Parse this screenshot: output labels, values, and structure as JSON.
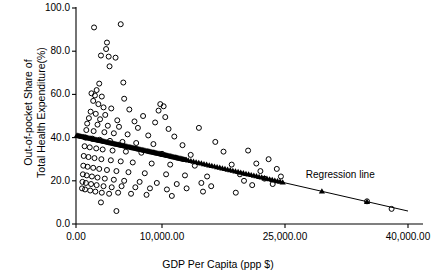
{
  "chart_data": {
    "type": "scatter",
    "title": "",
    "xlabel": "GDP Per Capita (ppp $)",
    "ylabel_line1": "Out-of-pocket Share of",
    "ylabel_line2": "Total Health Expenditure(%)",
    "xlim": [
      0,
      40000
    ],
    "ylim": [
      0,
      100
    ],
    "grid": false,
    "legend": "none",
    "xticks": [
      "0.00",
      "10,000.00",
      "25,000.00",
      "40,000.00"
    ],
    "xtick_values": [
      0,
      10000,
      25000,
      40000
    ],
    "yticks": [
      "0.0",
      "20.0",
      "40.0",
      "60.0",
      "80.0",
      "100.0"
    ],
    "ytick_values": [
      0,
      20,
      40,
      60,
      80,
      100
    ],
    "marker": "open-circle",
    "annotations": [
      {
        "text": "Regression line",
        "x": 29000,
        "y": 22.0
      }
    ],
    "series": [
      {
        "name": "Countries",
        "marker": "open-circle",
        "points": [
          [
            2100,
            91.0
          ],
          [
            5200,
            92.5
          ],
          [
            3600,
            84.0
          ],
          [
            3500,
            81.0
          ],
          [
            2900,
            78.0
          ],
          [
            3800,
            77.5
          ],
          [
            4600,
            77.0
          ],
          [
            3900,
            73.0
          ],
          [
            2700,
            65.0
          ],
          [
            5500,
            65.5
          ],
          [
            2400,
            62.0
          ],
          [
            1800,
            60.5
          ],
          [
            2200,
            59.5
          ],
          [
            3000,
            59.0
          ],
          [
            5600,
            58.0
          ],
          [
            2000,
            57.0
          ],
          [
            2600,
            55.5
          ],
          [
            9800,
            55.5
          ],
          [
            10200,
            54.5
          ],
          [
            3200,
            54.0
          ],
          [
            4100,
            53.5
          ],
          [
            6200,
            53.0
          ],
          [
            9600,
            52.5
          ],
          [
            1700,
            52.0
          ],
          [
            2300,
            51.0
          ],
          [
            3400,
            50.5
          ],
          [
            7800,
            50.0
          ],
          [
            10400,
            49.5
          ],
          [
            1500,
            49.0
          ],
          [
            2800,
            48.5
          ],
          [
            4800,
            48.0
          ],
          [
            6800,
            47.5
          ],
          [
            9200,
            47.0
          ],
          [
            1300,
            46.5
          ],
          [
            2500,
            46.0
          ],
          [
            3700,
            45.5
          ],
          [
            5000,
            45.0
          ],
          [
            7200,
            44.5
          ],
          [
            10800,
            44.0
          ],
          [
            14500,
            44.5
          ],
          [
            1200,
            43.5
          ],
          [
            2050,
            43.0
          ],
          [
            3300,
            42.5
          ],
          [
            4400,
            42.0
          ],
          [
            6000,
            41.5
          ],
          [
            8400,
            41.0
          ],
          [
            11500,
            40.5
          ],
          [
            1100,
            40.0
          ],
          [
            1900,
            39.5
          ],
          [
            2750,
            39.0
          ],
          [
            3950,
            38.5
          ],
          [
            5400,
            38.0
          ],
          [
            7000,
            37.5
          ],
          [
            9000,
            37.0
          ],
          [
            12500,
            36.5
          ],
          [
            16500,
            38.0
          ],
          [
            1000,
            36.0
          ],
          [
            1600,
            35.5
          ],
          [
            2350,
            35.0
          ],
          [
            3100,
            34.5
          ],
          [
            4250,
            34.0
          ],
          [
            5800,
            33.5
          ],
          [
            7600,
            33.0
          ],
          [
            10000,
            32.5
          ],
          [
            13500,
            32.0
          ],
          [
            17500,
            33.5
          ],
          [
            20500,
            34.0
          ],
          [
            900,
            31.5
          ],
          [
            1450,
            31.0
          ],
          [
            2150,
            30.5
          ],
          [
            2950,
            30.0
          ],
          [
            4050,
            29.5
          ],
          [
            5200,
            29.0
          ],
          [
            6600,
            28.5
          ],
          [
            8800,
            28.0
          ],
          [
            11000,
            27.5
          ],
          [
            14000,
            27.0
          ],
          [
            18500,
            27.5
          ],
          [
            21500,
            28.0
          ],
          [
            23000,
            30.0
          ],
          [
            850,
            27.0
          ],
          [
            1350,
            26.5
          ],
          [
            2000,
            26.0
          ],
          [
            2700,
            25.5
          ],
          [
            3600,
            25.0
          ],
          [
            4700,
            24.5
          ],
          [
            6100,
            24.0
          ],
          [
            8000,
            23.5
          ],
          [
            10500,
            23.0
          ],
          [
            12800,
            22.5
          ],
          [
            15500,
            22.0
          ],
          [
            19500,
            23.0
          ],
          [
            22000,
            24.5
          ],
          [
            24000,
            25.5
          ],
          [
            800,
            23.0
          ],
          [
            1250,
            22.5
          ],
          [
            1850,
            22.0
          ],
          [
            2500,
            21.5
          ],
          [
            3350,
            21.0
          ],
          [
            4400,
            20.5
          ],
          [
            5600,
            20.0
          ],
          [
            7400,
            19.5
          ],
          [
            9400,
            19.0
          ],
          [
            11800,
            18.5
          ],
          [
            14800,
            19.0
          ],
          [
            20000,
            20.0
          ],
          [
            22500,
            21.0
          ],
          [
            24500,
            22.0
          ],
          [
            750,
            19.5
          ],
          [
            1150,
            19.0
          ],
          [
            1750,
            18.5
          ],
          [
            2400,
            18.0
          ],
          [
            3200,
            17.5
          ],
          [
            4150,
            17.0
          ],
          [
            5300,
            17.5
          ],
          [
            6900,
            17.0
          ],
          [
            8600,
            16.5
          ],
          [
            10600,
            16.0
          ],
          [
            13000,
            16.5
          ],
          [
            16000,
            17.5
          ],
          [
            21000,
            18.0
          ],
          [
            23500,
            18.5
          ],
          [
            700,
            16.5
          ],
          [
            1050,
            16.0
          ],
          [
            1650,
            15.5
          ],
          [
            2250,
            15.0
          ],
          [
            3000,
            14.5
          ],
          [
            3850,
            14.0
          ],
          [
            4900,
            14.5
          ],
          [
            6400,
            14.0
          ],
          [
            8200,
            13.5
          ],
          [
            11200,
            13.0
          ],
          [
            15000,
            15.0
          ],
          [
            19000,
            14.5
          ],
          [
            2900,
            10.0
          ],
          [
            4700,
            6.0
          ],
          [
            35000,
            10.5
          ],
          [
            38000,
            7.0
          ]
        ]
      },
      {
        "name": "Regression line",
        "marker": "filled-triangle",
        "fit": {
          "intercept": 41.2,
          "slope": -0.00088,
          "x_start": 0,
          "x_end": 40000
        }
      }
    ]
  }
}
